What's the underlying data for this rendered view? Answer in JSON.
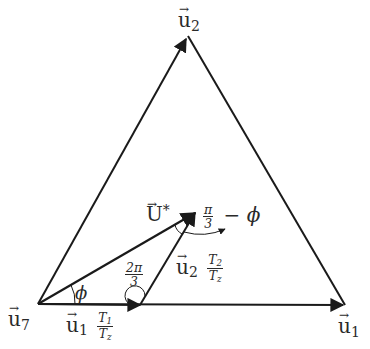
{
  "diagram": {
    "type": "space-vector-triangle",
    "colors": {
      "line": "#1a1a1a",
      "text": "#2a2a2a",
      "background": "#ffffff"
    },
    "vertices": {
      "u7": {
        "symbol": "u",
        "subscript": "7",
        "x": 38,
        "y": 304
      },
      "u1": {
        "symbol": "u",
        "subscript": "1",
        "x": 345,
        "y": 305
      },
      "u2": {
        "symbol": "u",
        "subscript": "2",
        "x": 188,
        "y": 36
      }
    },
    "labels": {
      "u2_vertex": {
        "symbol": "u",
        "subscript": "2"
      },
      "u1_vertex": {
        "symbol": "u",
        "subscript": "1"
      },
      "u7_vertex": {
        "symbol": "u",
        "subscript": "7"
      },
      "u_star": {
        "symbol": "U",
        "superscript": "*"
      },
      "u1_component": {
        "symbol": "u",
        "subscript": "1",
        "frac_num": "T",
        "frac_num_sub": "1",
        "frac_den": "T",
        "frac_den_sub": "z"
      },
      "u2_component": {
        "symbol": "u",
        "subscript": "2",
        "frac_num": "T",
        "frac_num_sub": "2",
        "frac_den": "T",
        "frac_den_sub": "z"
      },
      "angle_phi": "ϕ",
      "angle_two_pi_three": {
        "num": "2π",
        "den": "3"
      },
      "angle_pi_three_minus_phi": {
        "num": "π",
        "den": "3",
        "suffix": "− ϕ"
      }
    }
  }
}
